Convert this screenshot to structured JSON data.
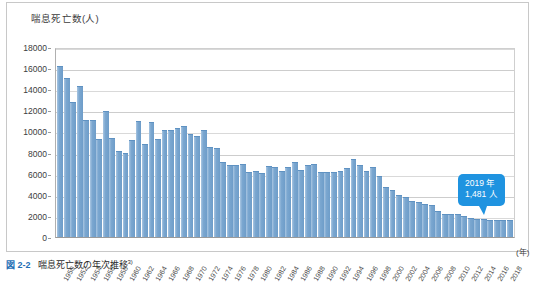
{
  "figure": {
    "caption_number": "図 2-2",
    "caption_text": "喘息死亡数の年次推移",
    "caption_superscript": "3)"
  },
  "axis": {
    "y_title": "喘息死亡数(人)",
    "x_unit": "(年)"
  },
  "callout": {
    "year_line": "2019 年",
    "value_line": "1,481 人",
    "color": "#1f93e0"
  },
  "colors": {
    "bar": "#7ba7d0",
    "bar_edge": "#5f92c2",
    "grid": "#d9d9d9",
    "axis": "#9a9a9a",
    "panel_border": "#c8c8c8",
    "caption_accent": "#1f6fb5"
  },
  "chart_data": {
    "type": "bar",
    "title": "喘息死亡数の年次推移",
    "xlabel": "(年)",
    "ylabel": "喘息死亡数(人)",
    "ylim": [
      0,
      18000
    ],
    "ytick_values": [
      0,
      2000,
      4000,
      6000,
      8000,
      10000,
      12000,
      14000,
      16000,
      18000
    ],
    "ytick_labels": [
      "0",
      "2000",
      "4000",
      "6000",
      "8000",
      "10000",
      "12000",
      "14000",
      "16000",
      "18000"
    ],
    "grid": true,
    "legend": false,
    "xtick_labels": [
      "1950",
      "1952",
      "1954",
      "1956",
      "1958",
      "1960",
      "1962",
      "1964",
      "1966",
      "1968",
      "1970",
      "1972",
      "1974",
      "1976",
      "1978",
      "1980",
      "1982",
      "1984",
      "1986",
      "1988",
      "1990",
      "1992",
      "1994",
      "1996",
      "1998",
      "2000",
      "2002",
      "2004",
      "2006",
      "2008",
      "2010",
      "2012",
      "2014",
      "2016",
      "2018"
    ],
    "xtick_step_years": 2,
    "categories": [
      "1950",
      "1951",
      "1952",
      "1953",
      "1954",
      "1955",
      "1956",
      "1957",
      "1958",
      "1959",
      "1960",
      "1961",
      "1962",
      "1963",
      "1964",
      "1965",
      "1966",
      "1967",
      "1968",
      "1969",
      "1970",
      "1971",
      "1972",
      "1973",
      "1974",
      "1975",
      "1976",
      "1977",
      "1978",
      "1979",
      "1980",
      "1981",
      "1982",
      "1983",
      "1984",
      "1985",
      "1986",
      "1987",
      "1988",
      "1989",
      "1990",
      "1991",
      "1992",
      "1993",
      "1994",
      "1995",
      "1996",
      "1997",
      "1998",
      "1999",
      "2000",
      "2001",
      "2002",
      "2003",
      "2004",
      "2005",
      "2006",
      "2007",
      "2008",
      "2009",
      "2010",
      "2011",
      "2012",
      "2013",
      "2014",
      "2015",
      "2016",
      "2017",
      "2018",
      "2019"
    ],
    "values": [
      16100,
      15000,
      12700,
      14200,
      11000,
      11000,
      9200,
      11800,
      9300,
      8100,
      7900,
      9100,
      10900,
      8700,
      10800,
      9200,
      10000,
      10000,
      10200,
      10400,
      9700,
      9500,
      10000,
      8400,
      8300,
      7000,
      6700,
      6700,
      6800,
      6100,
      6200,
      6000,
      6600,
      6500,
      6200,
      6500,
      7000,
      6300,
      6700,
      6800,
      6100,
      6100,
      6100,
      6200,
      6400,
      7250,
      6700,
      6200,
      6500,
      5700,
      4600,
      4400,
      3900,
      3700,
      3300,
      3200,
      3000,
      2900,
      2400,
      2100,
      2100,
      2100,
      1900,
      1700,
      1600,
      1600,
      1500,
      1500,
      1500,
      1481
    ],
    "annotations": [
      {
        "label": "2019 年 1,481 人",
        "x": "2019",
        "y": 1481
      }
    ]
  }
}
